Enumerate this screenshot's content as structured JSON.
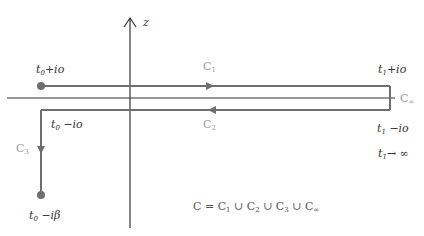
{
  "diagram": {
    "type": "contour-in-complex-plane",
    "axis_label": "z",
    "colors": {
      "axis": "#333333",
      "contour": "#6e6e6e",
      "contour_label": "#9a9a9a",
      "text": "#333333"
    },
    "points": {
      "start_upper": {
        "base": "t",
        "sub": "0",
        "rest": "+io"
      },
      "end_upper": {
        "base": "t",
        "sub": "1",
        "rest": "+io"
      },
      "start_lower": {
        "base": "t",
        "sub": "0",
        "rest": " −io"
      },
      "end_lower": {
        "base": "t",
        "sub": "1",
        "rest": " −io"
      },
      "bottom": {
        "base": "t",
        "sub": "0",
        "rest": " −iβ"
      }
    },
    "contours": {
      "c1": {
        "base": "C",
        "sub": "1"
      },
      "c2": {
        "base": "C",
        "sub": "2"
      },
      "c3": {
        "base": "C",
        "sub": "3"
      },
      "cinf": {
        "base": "C",
        "sub": "∞"
      }
    },
    "limit_note": {
      "base": "t",
      "sub": "1",
      "rest": "→ ∞"
    },
    "equation": {
      "lhs": "C = ",
      "terms": [
        {
          "base": "C",
          "sub": "1"
        },
        {
          "op": " ∪ "
        },
        {
          "base": "C",
          "sub": "2"
        },
        {
          "op": " ∪ "
        },
        {
          "base": "C",
          "sub": "3"
        },
        {
          "op": " ∪ "
        },
        {
          "base": "C",
          "sub": "∞"
        }
      ]
    }
  }
}
